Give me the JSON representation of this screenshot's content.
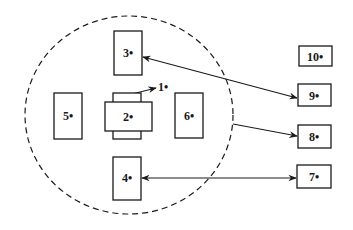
{
  "diagram": {
    "type": "block-layout",
    "colors": {
      "stroke": "#1a1a1a",
      "background": "#ffffff",
      "fill": "#ffffff"
    },
    "boundary": {
      "shape": "dashed-circle",
      "cx": 129,
      "cy": 115,
      "rx": 104,
      "ry": 99
    },
    "boxes": [
      {
        "id": "1",
        "label": "1•",
        "x": 113,
        "y": 93,
        "w": 28,
        "h": 46,
        "label_x": 163,
        "label_y": 91
      },
      {
        "id": "2",
        "label": "2•",
        "x": 105,
        "y": 102,
        "w": 47,
        "h": 29,
        "label_x": 128,
        "label_y": 121
      },
      {
        "id": "3",
        "label": "3•",
        "x": 114,
        "y": 31,
        "w": 28,
        "h": 44,
        "label_x": 128,
        "label_y": 57
      },
      {
        "id": "4",
        "label": "4•",
        "x": 113,
        "y": 157,
        "w": 28,
        "h": 43,
        "label_x": 127,
        "label_y": 182
      },
      {
        "id": "5",
        "label": "5•",
        "x": 54,
        "y": 93,
        "w": 28,
        "h": 46,
        "label_x": 68,
        "label_y": 120
      },
      {
        "id": "6",
        "label": "6•",
        "x": 175,
        "y": 93,
        "w": 28,
        "h": 45,
        "label_x": 189,
        "label_y": 120
      },
      {
        "id": "7",
        "label": "7•",
        "x": 297,
        "y": 165,
        "w": 34,
        "h": 23,
        "label_x": 314,
        "label_y": 181
      },
      {
        "id": "8",
        "label": "8•",
        "x": 298,
        "y": 125,
        "w": 33,
        "h": 23,
        "label_x": 314,
        "label_y": 141
      },
      {
        "id": "9",
        "label": "9•",
        "x": 298,
        "y": 84,
        "w": 33,
        "h": 22,
        "label_x": 314,
        "label_y": 100
      },
      {
        "id": "10",
        "label": "10•",
        "x": 299,
        "y": 46,
        "w": 33,
        "h": 20,
        "label_x": 315,
        "label_y": 61
      }
    ],
    "connectors": [
      {
        "id": "3-9",
        "from": "3",
        "to": "9",
        "x1": 143,
        "y1": 57,
        "x2": 297,
        "y2": 98,
        "start_arrow": true,
        "end_arrow": true
      },
      {
        "id": "6-8",
        "from": "boundary",
        "to": "8",
        "x1": 233,
        "y1": 124,
        "x2": 297,
        "y2": 136,
        "start_arrow": false,
        "end_arrow": true
      },
      {
        "id": "4-7",
        "from": "4",
        "to": "7",
        "x1": 142,
        "y1": 178,
        "x2": 296,
        "y2": 178,
        "start_arrow": true,
        "end_arrow": true
      },
      {
        "id": "1-leader",
        "from": "1",
        "to": "label-1",
        "x1": 132,
        "y1": 94,
        "x2": 156,
        "y2": 88,
        "start_arrow": false,
        "end_arrow": true
      }
    ]
  }
}
